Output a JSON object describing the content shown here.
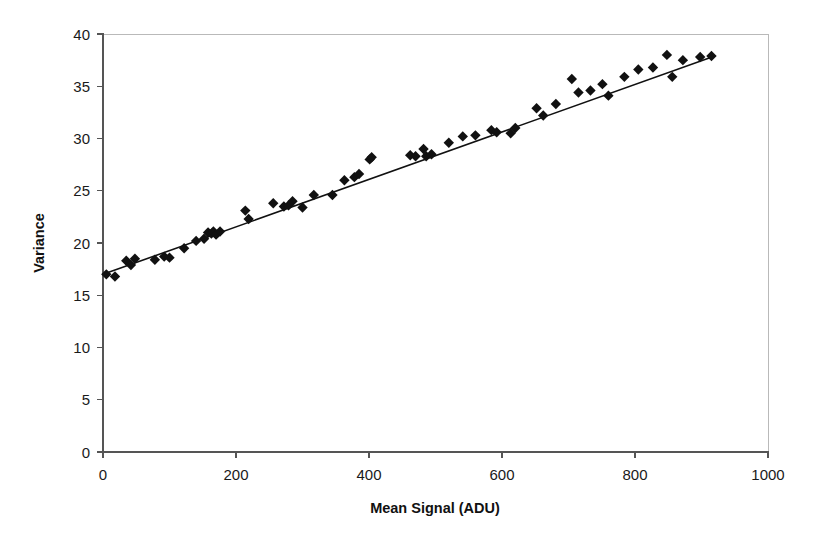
{
  "chart_data": {
    "type": "scatter",
    "title": "",
    "xlabel": "Mean Signal (ADU)",
    "ylabel": "Variance",
    "xlim": [
      0,
      1000
    ],
    "ylim": [
      0,
      40
    ],
    "xticks": [
      0,
      200,
      400,
      600,
      800,
      1000
    ],
    "yticks": [
      0,
      5,
      10,
      15,
      20,
      25,
      30,
      35,
      40
    ],
    "xtick_labels": [
      "0",
      "200",
      "400",
      "600",
      "800",
      "1000"
    ],
    "ytick_labels": [
      "0",
      "5",
      "10",
      "15",
      "20",
      "25",
      "30",
      "35",
      "40"
    ],
    "grid": false,
    "legend": null,
    "marker_style": "filled-diamond",
    "marker_color": "#111111",
    "line_color": "#111111",
    "series": [
      {
        "name": "Photon transfer data",
        "marker": "diamond",
        "points": [
          [
            5,
            17.0
          ],
          [
            18,
            16.8
          ],
          [
            35,
            18.3
          ],
          [
            42,
            17.9
          ],
          [
            48,
            18.5
          ],
          [
            78,
            18.4
          ],
          [
            92,
            18.7
          ],
          [
            100,
            18.6
          ],
          [
            122,
            19.5
          ],
          [
            140,
            20.2
          ],
          [
            152,
            20.4
          ],
          [
            158,
            21.0
          ],
          [
            163,
            20.9
          ],
          [
            166,
            21.1
          ],
          [
            170,
            20.8
          ],
          [
            176,
            21.1
          ],
          [
            214,
            23.1
          ],
          [
            219,
            22.3
          ],
          [
            256,
            23.8
          ],
          [
            272,
            23.5
          ],
          [
            279,
            23.6
          ],
          [
            285,
            24.0
          ],
          [
            300,
            23.4
          ],
          [
            317,
            24.6
          ],
          [
            345,
            24.6
          ],
          [
            363,
            26.0
          ],
          [
            378,
            26.3
          ],
          [
            385,
            26.6
          ],
          [
            401,
            28.0
          ],
          [
            404,
            28.2
          ],
          [
            462,
            28.4
          ],
          [
            470,
            28.3
          ],
          [
            482,
            29.0
          ],
          [
            486,
            28.3
          ],
          [
            494,
            28.5
          ],
          [
            520,
            29.6
          ],
          [
            541,
            30.2
          ],
          [
            560,
            30.3
          ],
          [
            584,
            30.8
          ],
          [
            592,
            30.6
          ],
          [
            613,
            30.5
          ],
          [
            620,
            31.0
          ],
          [
            652,
            32.9
          ],
          [
            662,
            32.2
          ],
          [
            681,
            33.3
          ],
          [
            705,
            35.7
          ],
          [
            715,
            34.4
          ],
          [
            733,
            34.6
          ],
          [
            751,
            35.2
          ],
          [
            760,
            34.1
          ],
          [
            784,
            35.9
          ],
          [
            805,
            36.6
          ],
          [
            827,
            36.8
          ],
          [
            848,
            38.0
          ],
          [
            856,
            35.9
          ],
          [
            872,
            37.5
          ],
          [
            898,
            37.8
          ],
          [
            915,
            37.9
          ]
        ]
      }
    ],
    "trendline": {
      "name": "least-squares fit",
      "x_start": 0,
      "y_start": 17.0,
      "x_end": 920,
      "y_end": 37.9
    }
  }
}
